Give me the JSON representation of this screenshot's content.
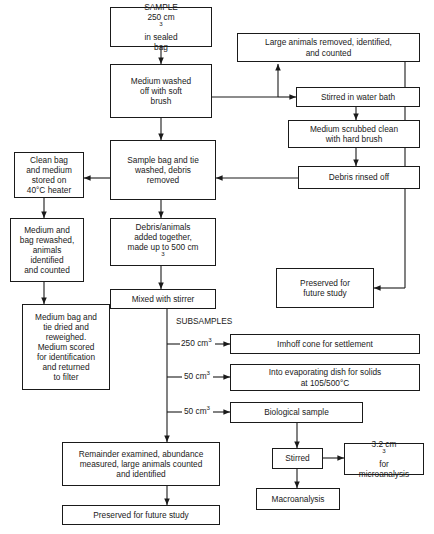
{
  "diagram": {
    "section_label": "SUBSAMPLES",
    "nodes": {
      "sample": "SAMPLE 250 cm3 in sealed bag",
      "sample_l1": "SAMPLE",
      "sample_l2a": "250 cm",
      "sample_l2sup": "3",
      "sample_l2b": " in sealed",
      "sample_l3": "bag",
      "medium_washed_l1": "Medium washed",
      "medium_washed_l2": "off with soft",
      "medium_washed_l3": "brush",
      "large_animals_l1": "Large animals removed, identified,",
      "large_animals_l2": "and counted",
      "stirred_water_bath": "Stirred in water bath",
      "medium_scrubbed_l1": "Medium scrubbed clean",
      "medium_scrubbed_l2": "with hard brush",
      "debris_rinsed": "Debris rinsed off",
      "clean_bag_l1": "Clean bag",
      "clean_bag_l2": "and medium",
      "clean_bag_l3": "stored on",
      "clean_bag_l4": "40°C heater",
      "sample_bag_l1": "Sample bag and tie",
      "sample_bag_l2": "washed, debris",
      "sample_bag_l3": "removed",
      "medium_rewashed_l1": "Medium and",
      "medium_rewashed_l2": "bag rewashed,",
      "medium_rewashed_l3": "animals",
      "medium_rewashed_l4": "identified",
      "medium_rewashed_l5": "and counted",
      "debris_animals_l1": "Debris/animals",
      "debris_animals_l2": "added together,",
      "debris_animals_l3a": "made up to 500 cm",
      "debris_animals_l3sup": "3",
      "medium_bag_dried_l1": "Medium bag and",
      "medium_bag_dried_l2": "tie dried and",
      "medium_bag_dried_l3": "reweighed.",
      "medium_bag_dried_l4": "Medium scored",
      "medium_bag_dried_l5": "for identification",
      "medium_bag_dried_l6": "and returned",
      "medium_bag_dried_l7": "to filter",
      "mixed_stirrer": "Mixed with stirrer",
      "preserved_right_l1": "Preserved for",
      "preserved_right_l2": "future study",
      "imhoff": "Imhoff cone for settlement",
      "evaporating_l1": "Into evaporating dish for solids",
      "evaporating_l2": "at 105/500°C",
      "biological": "Biological sample",
      "remainder_l1": "Remainder examined, abundance",
      "remainder_l2": "measured, large animals counted",
      "remainder_l3": "and identified",
      "preserved_bottom": "Preserved for future study",
      "stirred": "Stirred",
      "micro_l1a": "3.2 cm",
      "micro_l1sup": "3",
      "micro_l1b": " for",
      "micro_l2": "microanalysis",
      "macroanalysis": "Macroanalysis"
    },
    "branch_labels": {
      "b1a": "250 cm",
      "b1sup": "3",
      "b2a": "50 cm",
      "b2sup": "3",
      "b3a": "50 cm",
      "b3sup": "3"
    },
    "colors": {
      "stroke": "#1a1a1a",
      "background": "#ffffff",
      "text": "#1a1a1a"
    }
  }
}
